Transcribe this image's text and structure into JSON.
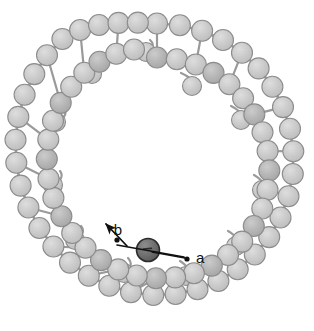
{
  "figure": {
    "domain": "Diagram",
    "title": "",
    "caption": "",
    "width": 314,
    "height": 331,
    "background_color": "#ffffff"
  },
  "style": {
    "bead_fill": "#c9c9c9",
    "bead_fill_dark": "#b2b2b2",
    "bead_stroke": "#8c8c8c",
    "bead_radius": 10.5,
    "bump_radius": 9.5,
    "link_stroke": "#9a9a9a",
    "highlight_fill": "#6e6e6e",
    "highlight_stroke": "#2b2b2b",
    "annotation_color": "#111111",
    "speckle_opacity": 0.18
  },
  "annotations": {
    "label_a": {
      "text": "a",
      "x": 196,
      "y": 259,
      "dot": {
        "x": 187,
        "y": 259,
        "r": 2.6
      },
      "arrow": {
        "from_x": 152,
        "from_y": 252,
        "to_x": 185,
        "to_y": 258
      },
      "meaning": "direction-a"
    },
    "label_b": {
      "text": "b",
      "x": 118,
      "y": 231,
      "dot": {
        "x": 117,
        "y": 240,
        "r": 2.6
      },
      "arrow": {
        "from_x": 127,
        "from_y": 246,
        "to_x": 106,
        "to_y": 224
      },
      "meaning": "direction-b"
    },
    "connector_line": {
      "from_x": 117,
      "from_y": 245,
      "to_x": 184,
      "to_y": 257,
      "via_x": 148,
      "via_y": 250
    }
  },
  "highlight": {
    "name": "highlighted-subunit",
    "x": 148,
    "y": 250,
    "r": 11.5,
    "tick": true
  },
  "ring": {
    "center_x": 157,
    "center_y": 163,
    "outer_radius": 140,
    "inner_radius": 104,
    "strand_count": 2,
    "bead_count_outer": 38,
    "bead_count_inner": 36,
    "bump_count": 11
  },
  "chain_outer": [
    [
      157.0,
      23.5
    ],
    [
      179.9,
      25.2
    ],
    [
      202.1,
      30.8
    ],
    [
      223.0,
      40.0
    ],
    [
      242.0,
      52.7
    ],
    [
      258.6,
      68.4
    ],
    [
      272.4,
      86.7
    ],
    [
      283.0,
      107.1
    ],
    [
      290.0,
      128.8
    ],
    [
      293.3,
      151.3
    ],
    [
      292.8,
      174.0
    ],
    [
      288.5,
      196.3
    ],
    [
      280.5,
      217.5
    ],
    [
      269.2,
      237.1
    ],
    [
      254.8,
      254.5
    ],
    [
      237.7,
      269.3
    ],
    [
      218.4,
      281.0
    ],
    [
      197.5,
      289.3
    ],
    [
      175.6,
      294.0
    ],
    [
      153.3,
      295.0
    ],
    [
      131.0,
      292.2
    ],
    [
      109.3,
      285.8
    ],
    [
      88.8,
      275.8
    ],
    [
      70.0,
      262.6
    ],
    [
      53.4,
      246.5
    ],
    [
      39.4,
      228.0
    ],
    [
      28.4,
      207.5
    ],
    [
      20.6,
      185.6
    ],
    [
      16.3,
      162.8
    ],
    [
      15.5,
      139.7
    ],
    [
      18.3,
      116.9
    ],
    [
      24.6,
      94.8
    ],
    [
      34.3,
      74.1
    ],
    [
      47.0,
      55.3
    ],
    [
      62.4,
      39.0
    ],
    [
      80.1,
      30.0
    ],
    [
      99.0,
      25.0
    ],
    [
      118.5,
      22.9
    ],
    [
      137.8,
      22.6
    ]
  ],
  "chain_inner": [
    [
      157.0,
      57.5
    ],
    [
      176.8,
      59.3
    ],
    [
      195.8,
      64.5
    ],
    [
      213.5,
      72.9
    ],
    [
      229.4,
      84.3
    ],
    [
      243.1,
      98.3
    ],
    [
      254.3,
      114.4
    ],
    [
      262.5,
      132.2
    ],
    [
      267.6,
      151.0
    ],
    [
      269.3,
      170.4
    ],
    [
      267.5,
      189.8
    ],
    [
      262.3,
      208.5
    ],
    [
      253.8,
      226.0
    ],
    [
      242.2,
      241.6
    ],
    [
      228.0,
      255.0
    ],
    [
      211.8,
      265.6
    ],
    [
      193.9,
      273.2
    ],
    [
      175.1,
      277.4
    ],
    [
      155.9,
      278.2
    ],
    [
      136.7,
      275.5
    ],
    [
      118.2,
      269.4
    ],
    [
      101.0,
      260.1
    ],
    [
      85.5,
      247.8
    ],
    [
      72.2,
      233.0
    ],
    [
      61.4,
      216.2
    ],
    [
      53.4,
      197.9
    ],
    [
      48.5,
      178.7
    ],
    [
      46.8,
      159.1
    ],
    [
      48.3,
      139.6
    ],
    [
      53.0,
      120.7
    ],
    [
      60.7,
      102.9
    ],
    [
      71.2,
      86.7
    ],
    [
      84.3,
      72.8
    ],
    [
      99.5,
      61.7
    ],
    [
      116.3,
      53.8
    ],
    [
      134.0,
      49.5
    ]
  ],
  "bumps": [
    {
      "x": 192.0,
      "y": 86.0,
      "hx": 181.0,
      "hy": 73.0
    },
    {
      "x": 241.0,
      "y": 120.0,
      "hx": 231.0,
      "hy": 106.0
    },
    {
      "x": 262.0,
      "y": 190.0,
      "hx": 254.0,
      "hy": 175.0
    },
    {
      "x": 236.0,
      "y": 246.0,
      "hx": 228.0,
      "hy": 231.0
    },
    {
      "x": 186.0,
      "y": 276.0,
      "hx": 180.0,
      "hy": 261.0
    },
    {
      "x": 124.0,
      "y": 273.0,
      "hx": 128.0,
      "hy": 258.0
    },
    {
      "x": 75.0,
      "y": 240.0,
      "hx": 81.0,
      "hy": 226.0
    },
    {
      "x": 53.0,
      "y": 185.0,
      "hx": 60.0,
      "hy": 171.0
    },
    {
      "x": 56.0,
      "y": 122.0,
      "hx": 64.0,
      "hy": 110.0
    },
    {
      "x": 92.0,
      "y": 74.0,
      "hx": 99.0,
      "hy": 62.0
    },
    {
      "x": 146.0,
      "y": 52.0,
      "hx": 150.0,
      "hy": 40.0
    }
  ]
}
